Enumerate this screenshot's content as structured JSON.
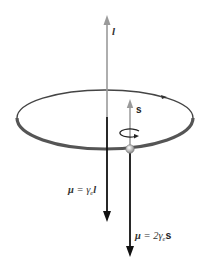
{
  "diagram": {
    "vectors": {
      "orbital_angular_momentum": {
        "label": "l",
        "color": "#9a9a9a"
      },
      "spin_angular_momentum": {
        "label": "s",
        "color": "#9a9a9a"
      },
      "orbital_moment": {
        "label_mu": "μ",
        "label_eq": " = γ",
        "label_sub": "e",
        "label_vec": "l",
        "color": "#111111"
      },
      "spin_moment": {
        "label_mu": "μ",
        "label_eq": " = 2γ",
        "label_sub": "e",
        "label_vec": "s",
        "color": "#111111"
      }
    },
    "orbit": {
      "stroke_front": "#555555",
      "stroke_back": "#444444"
    },
    "electron": {
      "fill": "#d8d8d8"
    }
  }
}
